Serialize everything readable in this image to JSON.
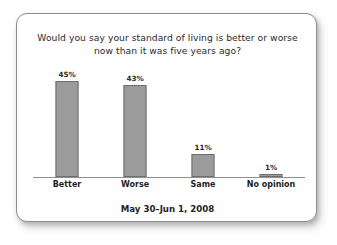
{
  "chart_data": {
    "type": "bar",
    "title": "Would you say your standard of living is better or worse now than it was five years ago?",
    "title_line1": "Would you say your standard of living is better or worse",
    "title_line2": "now than it was five years ago?",
    "categories": [
      "Better",
      "Worse",
      "Same",
      "No opinion"
    ],
    "values": [
      45,
      43,
      11,
      1
    ],
    "value_labels": [
      "45%",
      "43%",
      "11%",
      "1%"
    ],
    "xlabel": "",
    "ylabel": "",
    "ylim": [
      0,
      50
    ],
    "grid": false,
    "legend": false,
    "annotation": "May 30–Jun 1, 2008",
    "colors": {
      "bar_fill": "#9b9b9b",
      "bar_border": "#6e6e6e",
      "axis": "#8f8f8f",
      "text": "#2b2b2b",
      "card_border": "#8d8d8d",
      "background": "#ffffff"
    }
  },
  "footer": {
    "date_range": "May 30–Jun 1, 2008"
  }
}
